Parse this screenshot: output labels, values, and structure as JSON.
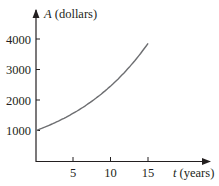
{
  "chart_data": {
    "type": "line",
    "title": "",
    "xlabel": "t (years)",
    "ylabel": "A (dollars)",
    "xlabel_var": "t",
    "xlabel_unit": "(years)",
    "ylabel_var": "A",
    "ylabel_unit": "(dollars)",
    "x_ticks": [
      5,
      10,
      15
    ],
    "y_ticks": [
      1000,
      2000,
      3000,
      4000
    ],
    "xlim": [
      0,
      20
    ],
    "ylim": [
      0,
      4500
    ],
    "grid": false,
    "legend": null,
    "series": [
      {
        "name": "A(t)",
        "x": [
          0,
          2.5,
          5,
          7.5,
          10,
          12.5,
          15
        ],
        "values": [
          1000,
          1252,
          1568,
          1964,
          2460,
          3080,
          3857
        ]
      }
    ],
    "colors": {
      "axis": "#231f20",
      "curve": "#6d6e71"
    }
  }
}
